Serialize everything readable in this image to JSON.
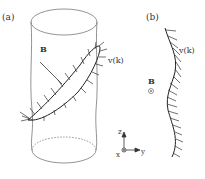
{
  "figure": {
    "panel_a": {
      "label": "(a)",
      "field_label": "B",
      "vector_label": "v(k)"
    },
    "panel_b": {
      "label": "(b)",
      "field_label": "B",
      "field_symbol": "⊙",
      "vector_label": "v(k)"
    },
    "axes": {
      "z_label": "z",
      "x_label": "x",
      "y_label": "y"
    },
    "colors": {
      "line": "#333333",
      "cylinder": "#777777",
      "background": "#ffffff"
    }
  }
}
